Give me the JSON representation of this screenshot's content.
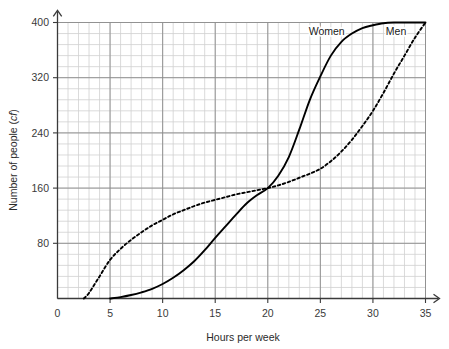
{
  "chart_data": {
    "type": "line",
    "title": "",
    "xlabel": "Hours per week",
    "ylabel": "Number of people (cf)",
    "ylabel_main": "Number of people (",
    "ylabel_unit": "cf",
    "ylabel_close": ")",
    "xlim": [
      0,
      35
    ],
    "ylim": [
      0,
      400
    ],
    "grid": true,
    "grid_minor": true,
    "x_ticks": [
      0,
      5,
      10,
      15,
      20,
      25,
      30,
      35
    ],
    "x_tick_labels": [
      "0",
      "5",
      "10",
      "15",
      "20",
      "25",
      "30",
      "35"
    ],
    "y_ticks": [
      0,
      80,
      160,
      240,
      320,
      400
    ],
    "y_tick_labels": [
      "0",
      "80",
      "160",
      "240",
      "320",
      "400"
    ],
    "y_tick_labels_shown": [
      "80",
      "160",
      "240",
      "320",
      "400"
    ],
    "legend_position": "inline-annotation",
    "series": [
      {
        "name": "Women",
        "style": "solid",
        "color": "#000000",
        "label_x": 25.6,
        "label_y": 382,
        "x": [
          5.0,
          6.0,
          7.0,
          8.0,
          9.0,
          10.0,
          11.0,
          12.0,
          13.0,
          14.0,
          15.0,
          16.0,
          17.0,
          18.0,
          19.0,
          20.0,
          21.0,
          22.0,
          23.0,
          24.0,
          25.0,
          26.0,
          27.0,
          28.0,
          29.0,
          30.0,
          31.0,
          32.0,
          33.0,
          34.0,
          35.0
        ],
        "values": [
          0,
          2,
          5,
          9,
          14,
          21,
          30,
          41,
          54,
          70,
          88,
          105,
          122,
          138,
          150,
          160,
          178,
          205,
          245,
          288,
          322,
          352,
          372,
          384,
          392,
          396,
          399,
          400,
          400,
          400,
          400
        ]
      },
      {
        "name": "Men",
        "style": "dashed",
        "color": "#000000",
        "label_x": 32.2,
        "label_y": 382,
        "x": [
          2.5,
          3.0,
          4.0,
          5.0,
          6.0,
          7.0,
          8.0,
          9.0,
          10.0,
          11.0,
          12.0,
          13.0,
          14.0,
          15.0,
          16.0,
          17.0,
          18.0,
          19.0,
          20.0,
          21.0,
          22.0,
          23.0,
          24.0,
          25.0,
          26.0,
          27.0,
          28.0,
          29.0,
          30.0,
          31.0,
          32.0,
          33.0,
          34.0,
          35.0
        ],
        "values": [
          0,
          8,
          32,
          56,
          72,
          85,
          96,
          106,
          114,
          122,
          128,
          134,
          139,
          143,
          147,
          151,
          154,
          157,
          160,
          164,
          169,
          175,
          181,
          188,
          199,
          213,
          230,
          250,
          272,
          298,
          326,
          352,
          378,
          400
        ]
      }
    ],
    "annotations": [
      {
        "text": "Women",
        "x": 25.6,
        "y": 382
      },
      {
        "text": "Men",
        "x": 32.2,
        "y": 382
      }
    ],
    "colors": {
      "axis": "#3a3a3a",
      "grid_minor": "#d0d0d0",
      "grid_major": "#8a8a8a",
      "series": "#000000",
      "background": "#ffffff"
    }
  }
}
